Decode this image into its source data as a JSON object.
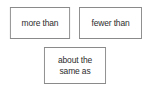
{
  "canvas": {
    "width": 152,
    "height": 88,
    "background_color": "#ffffff"
  },
  "style": {
    "border_color": "#8a8a8a",
    "text_color": "#2e2e2e",
    "box_fill_color": "#ffffff"
  },
  "options": [
    {
      "id": "more-than",
      "label": "more than",
      "lines": [
        "more than"
      ]
    },
    {
      "id": "fewer-than",
      "label": "fewer than",
      "lines": [
        "fewer than"
      ]
    },
    {
      "id": "about-the-same-as",
      "label": "about the\nsame as",
      "lines": [
        "about the",
        "same as"
      ]
    }
  ]
}
